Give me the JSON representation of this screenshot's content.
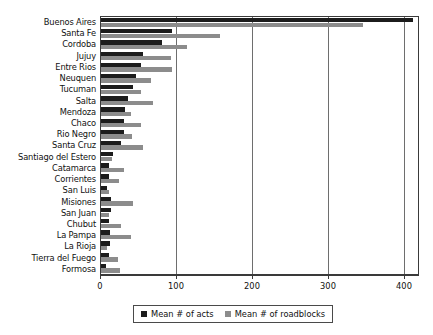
{
  "chart_data": {
    "type": "bar",
    "orientation": "horizontal",
    "title": "",
    "xlabel": "",
    "ylabel": "",
    "xlim": [
      0,
      420
    ],
    "xticks": [
      0,
      100,
      200,
      300,
      400
    ],
    "grid": true,
    "legend_position": "bottom",
    "categories": [
      "Buenos Aires",
      "Santa Fe",
      "Cordoba",
      "Jujuy",
      "Entre Rios",
      "Neuquen",
      "Tucuman",
      "Salta",
      "Mendoza",
      "Chaco",
      "Rio Negro",
      "Santa Cruz",
      "Santiago del Estero",
      "Catamarca",
      "Corrientes",
      "San Luis",
      "Misiones",
      "San Juan",
      "Chubut",
      "La Pampa",
      "La Rioja",
      "Tierra del Fuego",
      "Formosa"
    ],
    "series": [
      {
        "name": "Mean # of acts",
        "color": "#1c1c1c",
        "values": [
          410,
          93,
          80,
          55,
          53,
          46,
          42,
          36,
          32,
          30,
          30,
          26,
          16,
          11,
          11,
          8,
          13,
          13,
          11,
          12,
          12,
          10,
          6
        ]
      },
      {
        "name": "Mean # of roadblocks",
        "color": "#8c8c8c",
        "values": [
          345,
          156,
          113,
          92,
          94,
          66,
          53,
          68,
          40,
          52,
          41,
          55,
          15,
          30,
          24,
          11,
          42,
          10,
          26,
          40,
          8,
          23,
          25
        ]
      }
    ]
  },
  "legend": {
    "items": [
      {
        "label": "Mean # of acts",
        "color": "#1c1c1c"
      },
      {
        "label": "Mean # of roadblocks",
        "color": "#8c8c8c"
      }
    ]
  },
  "axis": {
    "tick_labels": [
      "0",
      "100",
      "200",
      "300",
      "400"
    ]
  }
}
